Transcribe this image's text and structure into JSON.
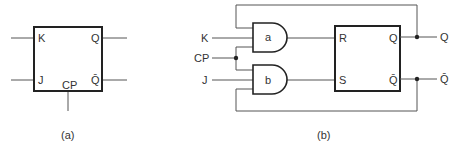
{
  "figure_a": {
    "caption": "(a)",
    "block": {
      "inputs": [
        {
          "label": "K"
        },
        {
          "label": "J"
        }
      ],
      "clock": {
        "label": "CP"
      },
      "outputs": [
        {
          "label": "Q"
        },
        {
          "label": "Q̄"
        }
      ]
    }
  },
  "figure_b": {
    "caption": "(b)",
    "inputs": [
      {
        "label": "K"
      },
      {
        "label": "CP"
      },
      {
        "label": "J"
      }
    ],
    "gates": [
      {
        "label": "a",
        "type": "AND"
      },
      {
        "label": "b",
        "type": "AND"
      }
    ],
    "flipflop": {
      "inputs": [
        {
          "label": "R"
        },
        {
          "label": "S"
        }
      ],
      "outputs": [
        {
          "label": "Q"
        },
        {
          "label": "Q̄"
        }
      ]
    },
    "outputs": [
      {
        "label": "Q"
      },
      {
        "label": "Q̄"
      }
    ]
  },
  "colors": {
    "line": "#222222",
    "wire": "#555555",
    "text": "#333333",
    "background": "#ffffff"
  }
}
